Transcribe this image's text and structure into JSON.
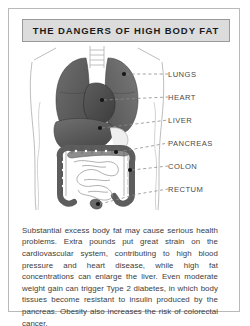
{
  "panel": {
    "title": "THE DANGERS OF HIGH BODY FAT",
    "background_color": "#ffffff",
    "frame_color": "#b9b9b9",
    "title_box_color": "#dcdcdc",
    "title_border_color": "#9a9a9a",
    "title_text_color": "#1b1b1b",
    "body_text_color": "#3d3d3d",
    "label_text_color": "#4a4a4a"
  },
  "illustration": {
    "alt": "anatomical-torso-diagram",
    "organ_fill_dark": "#5a5a5a",
    "organ_fill_mid": "#7d7d7d",
    "organ_fill_light": "#a8a8a8",
    "outline_color": "#9b9b9b",
    "marker_color": "#151515",
    "leader_color": "#8c8c8c"
  },
  "labels": [
    {
      "name": "LUNGS"
    },
    {
      "name": "HEART"
    },
    {
      "name": "LIVER"
    },
    {
      "name": "PANCREAS"
    },
    {
      "name": "COLON"
    },
    {
      "name": "RECTUM"
    }
  ],
  "body": {
    "paragraph": "Substantial excess body fat may cause serious health problems. Extra pounds put great strain on the cardiovascular system, contributing to high blood pressure and heart disease, while high fat concentrations can enlarge the liver. Even moderate weight gain can trigger Type 2 diabetes, in which body tissues become resistant to insulin produced by the pancreas. Obesity also increases the risk of colorectal cancer."
  }
}
